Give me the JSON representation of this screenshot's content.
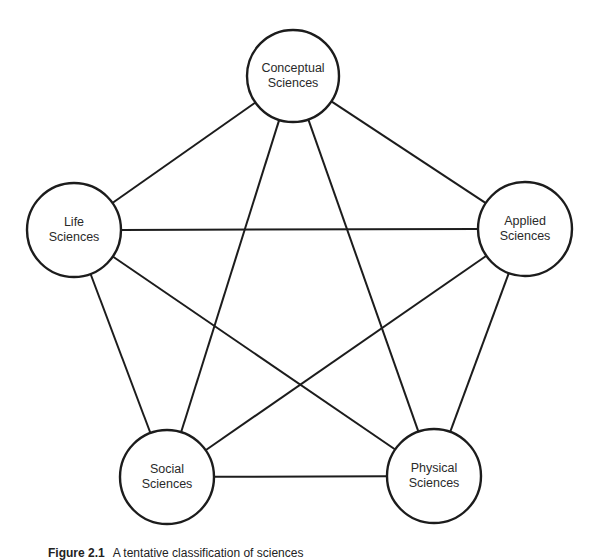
{
  "diagram": {
    "type": "complete-graph",
    "colors": {
      "stroke": "#1c1c1c",
      "fill": "#ffffff",
      "text": "#2a2a2a"
    },
    "nodes": [
      {
        "id": "conceptual",
        "line1": "Conceptual",
        "line2": "Sciences",
        "cx": 293,
        "cy": 76,
        "r": 46
      },
      {
        "id": "life",
        "line1": "Life",
        "line2": "Sciences",
        "cx": 74,
        "cy": 230,
        "r": 47
      },
      {
        "id": "applied",
        "line1": "Applied",
        "line2": "Sciences",
        "cx": 525,
        "cy": 229,
        "r": 47
      },
      {
        "id": "social",
        "line1": "Social",
        "line2": "Sciences",
        "cx": 167,
        "cy": 477,
        "r": 47
      },
      {
        "id": "physical",
        "line1": "Physical",
        "line2": "Sciences",
        "cx": 434,
        "cy": 476,
        "r": 47
      }
    ],
    "edges": [
      [
        "conceptual",
        "life"
      ],
      [
        "conceptual",
        "applied"
      ],
      [
        "conceptual",
        "social"
      ],
      [
        "conceptual",
        "physical"
      ],
      [
        "life",
        "applied"
      ],
      [
        "life",
        "social"
      ],
      [
        "life",
        "physical"
      ],
      [
        "applied",
        "social"
      ],
      [
        "applied",
        "physical"
      ],
      [
        "social",
        "physical"
      ]
    ]
  },
  "caption": {
    "figure_number": "Figure 2.1",
    "text": "A tentative classification of sciences"
  }
}
